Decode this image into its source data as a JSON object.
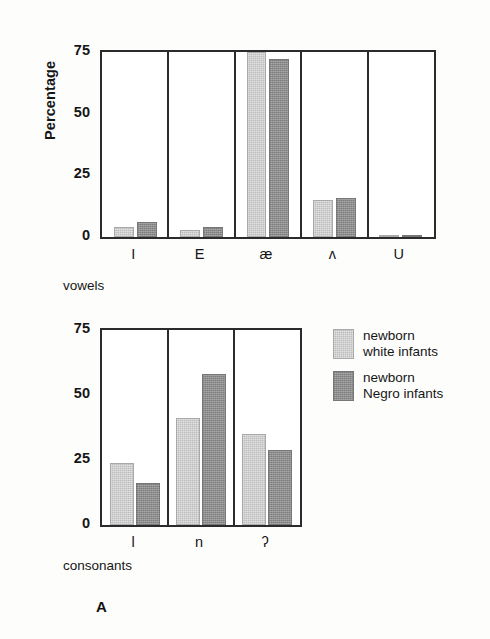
{
  "figure": {
    "panel_letter": "A",
    "background": "#fdfdfc",
    "colors": {
      "light_bar": "#bcbcbc",
      "dark_bar": "#8d8d8d",
      "axis": "#2b2b2b",
      "text": "#161616"
    }
  },
  "legend": {
    "items": [
      {
        "swatch": "light",
        "line1": "newborn",
        "line2": "white infants"
      },
      {
        "swatch": "dark",
        "line1": "newborn",
        "line2": "Negro infants"
      }
    ]
  },
  "chart_data": [
    {
      "type": "bar",
      "id": "vowels",
      "title": "",
      "xlabel": "vowels",
      "ylabel": "Percentage",
      "ylim": [
        0,
        75
      ],
      "yticks": [
        0,
        25,
        50,
        75
      ],
      "ytick_labels": [
        "0",
        "25",
        "50",
        "75"
      ],
      "grid": false,
      "group_separators": true,
      "legend_position": "right",
      "categories": [
        "I",
        "E",
        "æ",
        "ʌ",
        "U"
      ],
      "series": [
        {
          "name": "newborn white infants",
          "swatch": "light",
          "values": [
            4,
            3,
            77,
            15,
            1
          ]
        },
        {
          "name": "newborn Negro infants",
          "swatch": "dark",
          "values": [
            6,
            4,
            72,
            16,
            1
          ]
        }
      ]
    },
    {
      "type": "bar",
      "id": "consonants",
      "title": "",
      "xlabel": "consonants",
      "ylabel": "",
      "ylim": [
        0,
        75
      ],
      "yticks": [
        0,
        25,
        50,
        75
      ],
      "ytick_labels": [
        "0",
        "25",
        "50",
        "75"
      ],
      "grid": false,
      "group_separators": true,
      "legend_position": "right",
      "categories": [
        "l",
        "n",
        "ʔ"
      ],
      "series": [
        {
          "name": "newborn white infants",
          "swatch": "light",
          "values": [
            24,
            41,
            35
          ]
        },
        {
          "name": "newborn Negro infants",
          "swatch": "dark",
          "values": [
            16,
            58,
            29
          ]
        }
      ]
    }
  ]
}
